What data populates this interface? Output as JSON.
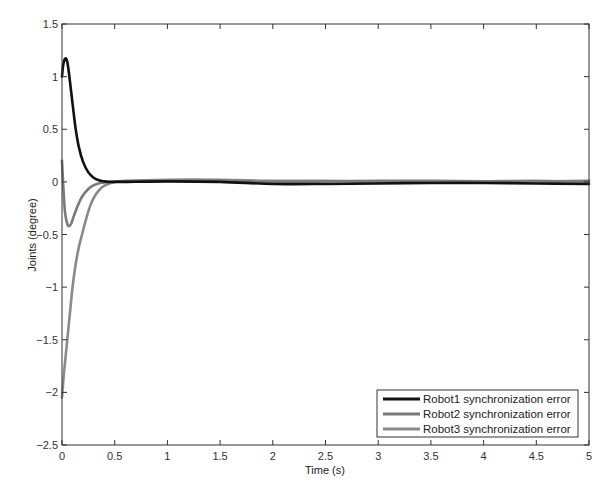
{
  "chart_data": {
    "type": "line",
    "title": "",
    "xlabel": "Time (s)",
    "ylabel": "Joints (degree)",
    "xlim": [
      0,
      5
    ],
    "ylim": [
      -2.5,
      1.5
    ],
    "xticks": [
      0,
      0.5,
      1,
      1.5,
      2,
      2.5,
      3,
      3.5,
      4,
      4.5,
      5
    ],
    "xtick_labels": [
      "0",
      "0.5",
      "1",
      "1.5",
      "2",
      "2.5",
      "3",
      "3.5",
      "4",
      "4.5",
      "5"
    ],
    "yticks": [
      1.5,
      1,
      0.5,
      0,
      -0.5,
      -1,
      -1.5,
      -2,
      -2.5
    ],
    "ytick_labels": [
      "1.5",
      "1",
      "0.5",
      "0",
      "-0.5",
      "-1",
      "-1.5",
      "-2",
      "-2.5"
    ],
    "grid": false,
    "legend_position": "lower right",
    "series": [
      {
        "name": "Robot1 synchronization error",
        "color": "#111111",
        "width": 2.6,
        "x": [
          0,
          0.01,
          0.02,
          0.03,
          0.04,
          0.05,
          0.06,
          0.07,
          0.09,
          0.11,
          0.13,
          0.16,
          0.2,
          0.25,
          0.3,
          0.35,
          0.4,
          0.45,
          0.5,
          0.6,
          1.0,
          1.5,
          2.0,
          2.5,
          3.0,
          3.5,
          4.0,
          4.5,
          5.0
        ],
        "y": [
          1.0,
          1.1,
          1.15,
          1.17,
          1.17,
          1.14,
          1.08,
          1.0,
          0.83,
          0.66,
          0.5,
          0.33,
          0.19,
          0.09,
          0.04,
          0.015,
          0.005,
          0.0,
          0.0,
          0.0,
          0.005,
          0.0,
          -0.02,
          -0.02,
          -0.015,
          -0.01,
          -0.01,
          -0.015,
          -0.02
        ]
      },
      {
        "name": "Robot2 synchronization error",
        "color": "#7a7a7a",
        "width": 2.6,
        "x": [
          0,
          0.01,
          0.02,
          0.03,
          0.05,
          0.07,
          0.09,
          0.11,
          0.14,
          0.18,
          0.22,
          0.27,
          0.33,
          0.4,
          0.5,
          0.6,
          1.0,
          1.5,
          2.0,
          2.5,
          3.0,
          3.5,
          4.0,
          4.5,
          5.0
        ],
        "y": [
          0.2,
          0.0,
          -0.18,
          -0.3,
          -0.4,
          -0.42,
          -0.39,
          -0.33,
          -0.25,
          -0.16,
          -0.1,
          -0.05,
          -0.02,
          -0.005,
          0.0,
          0.005,
          0.01,
          0.01,
          0.0,
          0.005,
          0.01,
          0.01,
          0.005,
          0.005,
          0.01
        ]
      },
      {
        "name": "Robot3 synchronization error",
        "color": "#8a8a8a",
        "width": 2.6,
        "x": [
          0,
          0.02,
          0.05,
          0.08,
          0.1,
          0.13,
          0.16,
          0.19,
          0.23,
          0.27,
          0.32,
          0.38,
          0.45,
          0.5,
          0.6,
          1.0,
          1.5,
          2.0,
          2.5,
          3.0,
          3.5,
          4.0,
          4.5,
          5.0
        ],
        "y": [
          -2.05,
          -1.8,
          -1.5,
          -1.2,
          -1.0,
          -0.78,
          -0.62,
          -0.5,
          -0.35,
          -0.22,
          -0.12,
          -0.05,
          -0.015,
          0.0,
          0.01,
          0.02,
          0.02,
          0.01,
          0.01,
          0.0,
          0.0,
          0.005,
          0.01,
          0.0
        ]
      }
    ]
  }
}
